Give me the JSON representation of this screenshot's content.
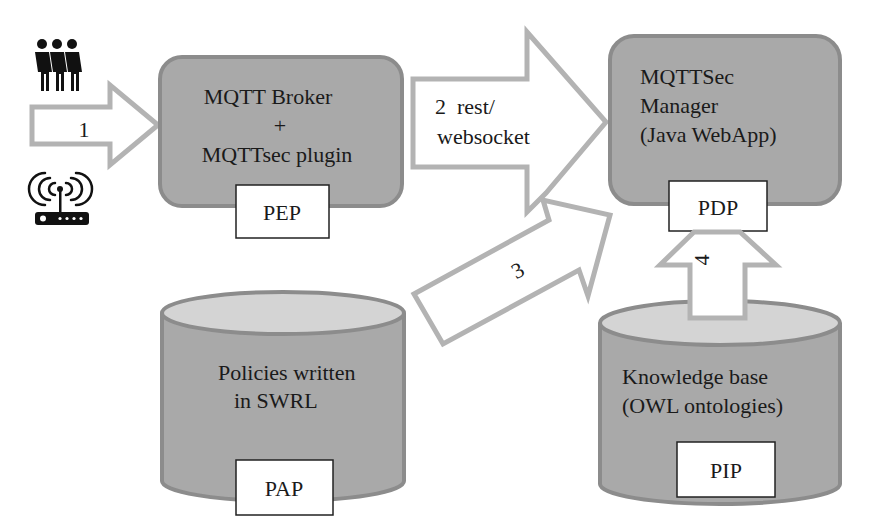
{
  "diagram": {
    "colors": {
      "component_fill": "#a9a9a9",
      "component_stroke": "#8c8c8c",
      "cylinder_top_fill": "#d4d4d4",
      "arrow_fill": "#ffffff",
      "arrow_stroke": "#b3b3b3",
      "tag_fill": "#ffffff",
      "tag_stroke": "#222222",
      "icon_color": "#111111"
    },
    "actors": {
      "users_icon": "users-icon",
      "device_icon": "wifi-router-icon"
    },
    "nodes": {
      "broker": {
        "line1": "MQTT Broker",
        "line2": "+",
        "line3": "MQTTsec plugin",
        "tag": "PEP"
      },
      "manager": {
        "line1": "MQTTSec",
        "line2": "Manager",
        "line3": "(Java WebApp)",
        "tag": "PDP"
      },
      "policies": {
        "line1": "Policies written",
        "line2": "in SWRL",
        "tag": "PAP"
      },
      "knowledge": {
        "line1": "Knowledge base",
        "line2": "(OWL ontologies)",
        "tag": "PIP"
      }
    },
    "arrows": {
      "a1": {
        "label": "1"
      },
      "a2": {
        "line1": "2  rest/",
        "line2": "websocket"
      },
      "a3": {
        "label": "3"
      },
      "a4": {
        "label": "4"
      }
    }
  }
}
